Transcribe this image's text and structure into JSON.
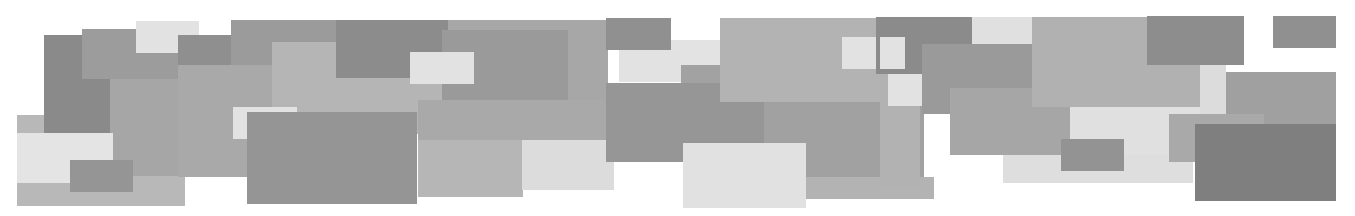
{
  "canvas": {
    "width": 1355,
    "height": 216,
    "background": "#ffffff"
  },
  "palette": {
    "lightest": "#e4e4e4",
    "light": "#d2d2d2",
    "mid_light": "#b8b8b8",
    "mid": "#a9a9a9",
    "mid_dark": "#9a9a9a",
    "dark": "#8c8c8c",
    "darkest": "#7e7e7e"
  },
  "rectangles": [
    {
      "x": 17,
      "y": 115,
      "w": 168,
      "h": 91,
      "color": "#b8b8b8"
    },
    {
      "x": 44,
      "y": 35,
      "w": 66,
      "h": 98,
      "color": "#8a8a8a"
    },
    {
      "x": 82,
      "y": 29,
      "w": 100,
      "h": 50,
      "color": "#9c9c9c"
    },
    {
      "x": 136,
      "y": 21,
      "w": 63,
      "h": 32,
      "color": "#e2e2e2"
    },
    {
      "x": 178,
      "y": 35,
      "w": 120,
      "h": 30,
      "color": "#8f8f8f"
    },
    {
      "x": 231,
      "y": 20,
      "w": 105,
      "h": 45,
      "color": "#9b9b9b"
    },
    {
      "x": 110,
      "y": 79,
      "w": 170,
      "h": 97,
      "color": "#a6a6a6"
    },
    {
      "x": 178,
      "y": 65,
      "w": 120,
      "h": 112,
      "color": "#a9a9a9"
    },
    {
      "x": 272,
      "y": 42,
      "w": 170,
      "h": 92,
      "color": "#b5b5b5"
    },
    {
      "x": 336,
      "y": 20,
      "w": 115,
      "h": 58,
      "color": "#8c8c8c"
    },
    {
      "x": 17,
      "y": 133,
      "w": 96,
      "h": 50,
      "color": "#e4e4e4"
    },
    {
      "x": 70,
      "y": 160,
      "w": 63,
      "h": 32,
      "color": "#959595"
    },
    {
      "x": 233,
      "y": 107,
      "w": 64,
      "h": 32,
      "color": "#e2e2e2"
    },
    {
      "x": 410,
      "y": 52,
      "w": 62,
      "h": 32,
      "color": "#e2e2e2"
    },
    {
      "x": 448,
      "y": 20,
      "w": 160,
      "h": 90,
      "color": "#a7a7a7"
    },
    {
      "x": 442,
      "y": 30,
      "w": 126,
      "h": 70,
      "color": "#9a9a9a"
    },
    {
      "x": 442,
      "y": 52,
      "w": 32,
      "h": 32,
      "color": "#e2e2e2"
    },
    {
      "x": 418,
      "y": 100,
      "w": 190,
      "h": 40,
      "color": "#a9a9a9"
    },
    {
      "x": 418,
      "y": 140,
      "w": 105,
      "h": 57,
      "color": "#b6b6b6"
    },
    {
      "x": 522,
      "y": 140,
      "w": 92,
      "h": 50,
      "color": "#dcdcdc"
    },
    {
      "x": 297,
      "y": 134,
      "w": 120,
      "h": 58,
      "color": "#b5b5b5"
    },
    {
      "x": 247,
      "y": 112,
      "w": 170,
      "h": 92,
      "color": "#959595"
    },
    {
      "x": 606,
      "y": 18,
      "w": 65,
      "h": 32,
      "color": "#909090"
    },
    {
      "x": 671,
      "y": 40,
      "w": 50,
      "h": 26,
      "color": "#e3e3e3"
    },
    {
      "x": 619,
      "y": 50,
      "w": 62,
      "h": 32,
      "color": "#e2e2e2"
    },
    {
      "x": 681,
      "y": 65,
      "w": 40,
      "h": 18,
      "color": "#a2a2a2"
    },
    {
      "x": 606,
      "y": 83,
      "w": 158,
      "h": 79,
      "color": "#969696"
    },
    {
      "x": 720,
      "y": 18,
      "w": 160,
      "h": 84,
      "color": "#b3b3b3"
    },
    {
      "x": 764,
      "y": 102,
      "w": 160,
      "h": 75,
      "color": "#a1a1a1"
    },
    {
      "x": 804,
      "y": 177,
      "w": 130,
      "h": 22,
      "color": "#b3b3b3"
    },
    {
      "x": 683,
      "y": 143,
      "w": 123,
      "h": 65,
      "color": "#e1e1e1"
    },
    {
      "x": 842,
      "y": 37,
      "w": 63,
      "h": 32,
      "color": "#e2e2e2"
    },
    {
      "x": 876,
      "y": 17,
      "w": 96,
      "h": 57,
      "color": "#8b8b8b"
    },
    {
      "x": 880,
      "y": 37,
      "w": 25,
      "h": 32,
      "color": "#e2e2e2"
    },
    {
      "x": 880,
      "y": 74,
      "w": 40,
      "h": 112,
      "color": "#b2b2b2"
    },
    {
      "x": 888,
      "y": 74,
      "w": 34,
      "h": 32,
      "color": "#e2e2e2"
    },
    {
      "x": 922,
      "y": 44,
      "w": 110,
      "h": 70,
      "color": "#9a9a9a"
    },
    {
      "x": 972,
      "y": 17,
      "w": 60,
      "h": 27,
      "color": "#e0e0e0"
    },
    {
      "x": 950,
      "y": 88,
      "w": 120,
      "h": 67,
      "color": "#a6a6a6"
    },
    {
      "x": 1003,
      "y": 155,
      "w": 120,
      "h": 28,
      "color": "#dedede"
    },
    {
      "x": 1032,
      "y": 17,
      "w": 180,
      "h": 90,
      "color": "#b1b1b1"
    },
    {
      "x": 1070,
      "y": 107,
      "w": 130,
      "h": 50,
      "color": "#e0e0e0"
    },
    {
      "x": 1123,
      "y": 155,
      "w": 70,
      "h": 28,
      "color": "#dedede"
    },
    {
      "x": 1061,
      "y": 139,
      "w": 63,
      "h": 32,
      "color": "#939393"
    },
    {
      "x": 1147,
      "y": 16,
      "w": 97,
      "h": 49,
      "color": "#8d8d8d"
    },
    {
      "x": 1200,
      "y": 65,
      "w": 26,
      "h": 50,
      "color": "#dcdcdc"
    },
    {
      "x": 1226,
      "y": 72,
      "w": 110,
      "h": 52,
      "color": "#a0a0a0"
    },
    {
      "x": 1169,
      "y": 114,
      "w": 95,
      "h": 48,
      "color": "#a9a9a9"
    },
    {
      "x": 1195,
      "y": 124,
      "w": 141,
      "h": 77,
      "color": "#7f7f7f"
    },
    {
      "x": 1273,
      "y": 16,
      "w": 63,
      "h": 32,
      "color": "#909090"
    }
  ]
}
